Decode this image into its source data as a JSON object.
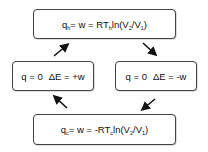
{
  "diagram": {
    "nodes": {
      "top": {
        "q": "q",
        "q_sub": "h",
        "eq1": "= w = RT",
        "t_sub": "h",
        "ln": "ln(V",
        "v2_sub": "2",
        "slash": "/V",
        "v1_sub": "1",
        "close": ")"
      },
      "left": {
        "q_part": "q = 0",
        "delta_part": "ΔE = +w"
      },
      "right": {
        "q_part": "q = 0",
        "delta_part": "ΔE = -w"
      },
      "bottom": {
        "q": "q",
        "q_sub": "c",
        "eq1": "= w = -RT",
        "t_sub": "c",
        "ln": "ln(V",
        "v2_sub": "2",
        "slash": "/V",
        "v1_sub": "1",
        "close": ")"
      }
    },
    "edges": [
      {
        "from": "top",
        "to": "right",
        "direction": "down-right"
      },
      {
        "from": "right",
        "to": "bottom",
        "direction": "down-left"
      },
      {
        "from": "bottom",
        "to": "left",
        "direction": "up-left"
      },
      {
        "from": "left",
        "to": "top",
        "direction": "up-right"
      }
    ],
    "colors": {
      "border": "#444444",
      "arrow": "#111111",
      "text": "#111111",
      "background": "#ffffff"
    }
  }
}
